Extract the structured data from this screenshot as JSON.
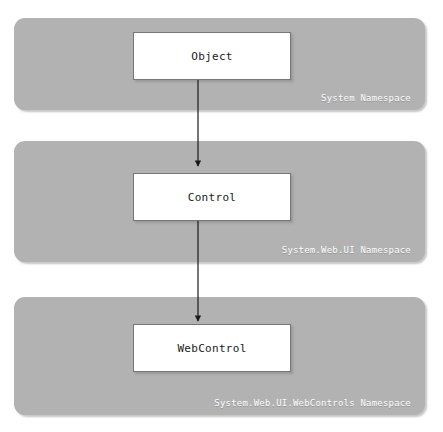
{
  "diagram": {
    "background_color": "#ffffff",
    "panel_color": "#b2b2b2",
    "panel_border_color": "#9a9a9a",
    "box_fill_color": "#ffffff",
    "box_border_color": "#777777",
    "caption_color": "#ffffff",
    "arrow_color": "#1a1a1a",
    "panels": [
      {
        "id": "system-namespace",
        "caption": "System Namespace",
        "class_box": {
          "id": "object-class",
          "label": "Object"
        }
      },
      {
        "id": "system-web-ui-namespace",
        "caption": "System.Web.UI Namespace",
        "class_box": {
          "id": "control-class",
          "label": "Control"
        }
      },
      {
        "id": "system-web-ui-webcontrols-namespace",
        "caption": "System.Web.UI.WebControls Namespace",
        "class_box": {
          "id": "webcontrol-class",
          "label": "WebControl"
        }
      }
    ],
    "connectors": [
      {
        "id": "object-to-control",
        "from": "Object",
        "to": "Control",
        "style": "solid-arrow-down"
      },
      {
        "id": "control-to-webcontrol",
        "from": "Control",
        "to": "WebControl",
        "style": "solid-arrow-down"
      }
    ]
  }
}
